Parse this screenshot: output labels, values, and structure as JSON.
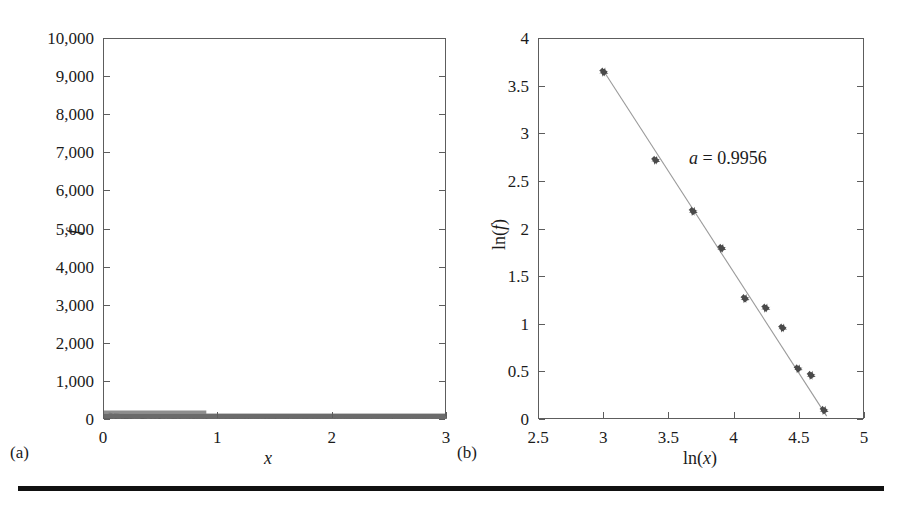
{
  "figure": {
    "caption_a": "(a)",
    "caption_b": "(b)"
  },
  "chart_data": [
    {
      "type": "scatter",
      "panel": "(a)",
      "title": "",
      "xlabel": "x",
      "ylabel": "f",
      "xlim": [
        0,
        3
      ],
      "ylim": [
        0,
        10000
      ],
      "xticks": [
        0,
        1,
        2,
        3
      ],
      "xtick_labels": [
        "0",
        "1",
        "2",
        "3"
      ],
      "yticks": [
        0,
        1000,
        2000,
        3000,
        4000,
        5000,
        6000,
        7000,
        8000,
        9000,
        10000
      ],
      "ytick_labels": [
        "0",
        "1,000",
        "2,000",
        "3,000",
        "4,000",
        "5,000",
        "6,000",
        "7,000",
        "8,000",
        "9,000",
        "10,000"
      ],
      "grid": false,
      "legend": "none",
      "marker_color": "#6e6e6e",
      "description": "Dense band of points lying essentially on f = 0 across the whole x range, slightly thicker near x = 0",
      "x": [
        0.0,
        0.03,
        0.06,
        0.09,
        0.12,
        0.15,
        0.2,
        0.25,
        0.3,
        0.35,
        0.4,
        0.45,
        0.5,
        0.6,
        0.7,
        0.8,
        0.9,
        1.0,
        1.1,
        1.2,
        1.3,
        1.4,
        1.5,
        1.6,
        1.7,
        1.8,
        1.9,
        2.0,
        2.1,
        2.2,
        2.3,
        2.4,
        2.5,
        2.6,
        2.7,
        2.8,
        2.9,
        3.0
      ],
      "y": [
        120,
        95,
        80,
        72,
        66,
        60,
        54,
        48,
        44,
        40,
        37,
        34,
        32,
        28,
        25,
        23,
        21,
        19,
        18,
        17,
        16,
        15,
        14,
        13,
        12,
        12,
        11,
        11,
        10,
        10,
        9,
        9,
        8,
        8,
        8,
        7,
        7,
        7
      ]
    },
    {
      "type": "scatter",
      "panel": "(b)",
      "title": "",
      "xlabel": "ln(x)",
      "ylabel": "ln(f)",
      "xlim": [
        2.5,
        5
      ],
      "ylim": [
        0,
        4
      ],
      "xticks": [
        2.5,
        3,
        3.5,
        4,
        4.5,
        5
      ],
      "xtick_labels": [
        "2.5",
        "3",
        "3.5",
        "4",
        "4.5",
        "5"
      ],
      "yticks": [
        0,
        0.5,
        1,
        1.5,
        2,
        2.5,
        3,
        3.5,
        4
      ],
      "ytick_labels": [
        "0",
        "0.5",
        "1",
        "1.5",
        "2",
        "2.5",
        "3",
        "3.5",
        "4"
      ],
      "grid": false,
      "legend": "none",
      "marker_color": "#4a4a4a",
      "marker_style": "plus",
      "fit_line_color": "#9a9a9a",
      "annotation": "a = 0.9956",
      "annotation_symbol": "a",
      "annotation_value": "0.9956",
      "x": [
        3.0,
        3.4,
        3.69,
        3.91,
        4.09,
        4.25,
        4.38,
        4.5,
        4.6,
        4.7
      ],
      "y": [
        3.65,
        2.72,
        2.18,
        1.79,
        1.26,
        1.16,
        0.95,
        0.52,
        0.45,
        0.08
      ],
      "fit": {
        "x_start": 3.0,
        "y_start": 3.66,
        "x_end": 4.72,
        "y_end": 0.02,
        "slope": -2.12,
        "description": "Straight fitted line through the scatter points"
      }
    }
  ]
}
